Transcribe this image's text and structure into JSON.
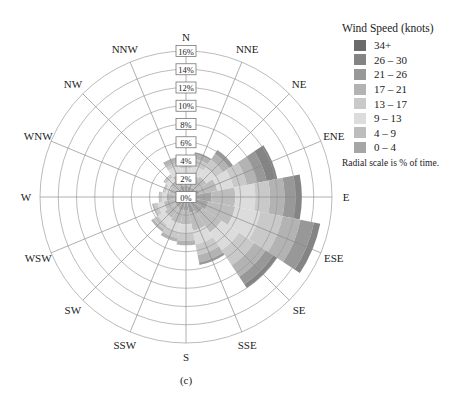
{
  "chart_data": {
    "type": "wind-rose",
    "title": "",
    "caption": "(c)",
    "radial_axis": {
      "unit": "%",
      "range": [
        0,
        16
      ],
      "ticks": [
        "0%",
        "2%",
        "4%",
        "6%",
        "8%",
        "10%",
        "12%",
        "14%",
        "16%"
      ],
      "tick_values": [
        0,
        2,
        4,
        6,
        8,
        10,
        12,
        14,
        16
      ],
      "note": "Radial scale is % of time."
    },
    "directions": [
      "N",
      "NNE",
      "NE",
      "ENE",
      "E",
      "ESE",
      "SE",
      "SSE",
      "S",
      "SSW",
      "SW",
      "WSW",
      "W",
      "WNW",
      "NW",
      "NNW"
    ],
    "legend": {
      "title": "Wind Speed (knots)",
      "placement": "top-right",
      "entries": [
        {
          "label": "34+",
          "color": "#6b6b6b"
        },
        {
          "label": "26 – 30",
          "color": "#848484"
        },
        {
          "label": "21 – 26",
          "color": "#989898"
        },
        {
          "label": "17 – 21",
          "color": "#b3b3b3"
        },
        {
          "label": "13 – 17",
          "color": "#c9c9c9"
        },
        {
          "label": "9 – 13",
          "color": "#dcdcdc"
        },
        {
          "label": "4 – 9",
          "color": "#bdbdbd"
        },
        {
          "label": "0 – 4",
          "color": "#a6a6a6"
        }
      ]
    },
    "speed_bins": [
      "0 – 4",
      "4 – 9",
      "9 – 13",
      "13 – 17",
      "17 – 21",
      "21 – 26",
      "26 – 30",
      "34+"
    ],
    "bin_colors": [
      "#a6a6a6",
      "#bdbdbd",
      "#dcdcdc",
      "#c9c9c9",
      "#b3b3b3",
      "#989898",
      "#848484",
      "#6b6b6b"
    ],
    "series": [
      {
        "direction": "N",
        "values": [
          1.2,
          1.2,
          0.8,
          0.5,
          0.3,
          0,
          0,
          0
        ]
      },
      {
        "direction": "NNE",
        "values": [
          1.2,
          1.3,
          1.0,
          0.8,
          0.5,
          0.2,
          0,
          0
        ]
      },
      {
        "direction": "NE",
        "values": [
          1.2,
          1.5,
          1.2,
          1.0,
          0.8,
          0.5,
          0,
          0
        ]
      },
      {
        "direction": "ENE",
        "values": [
          1.5,
          2.0,
          1.8,
          1.5,
          1.2,
          1.0,
          1.2,
          0
        ]
      },
      {
        "direction": "E",
        "values": [
          2.8,
          2.6,
          2.2,
          1.6,
          1.6,
          1.2,
          0.7,
          0
        ]
      },
      {
        "direction": "ESE",
        "values": [
          2.5,
          3.0,
          2.8,
          2.5,
          2.0,
          1.5,
          0.7,
          0
        ]
      },
      {
        "direction": "SE",
        "values": [
          2.2,
          2.5,
          2.3,
          2.0,
          1.5,
          1.0,
          0.5,
          0
        ]
      },
      {
        "direction": "SSE",
        "values": [
          1.8,
          2.0,
          1.5,
          1.2,
          0.8,
          0.3,
          0,
          0
        ]
      },
      {
        "direction": "S",
        "values": [
          1.5,
          1.5,
          1.0,
          0.8,
          0.5,
          0,
          0,
          0
        ]
      },
      {
        "direction": "SSW",
        "values": [
          1.5,
          1.5,
          1.0,
          0.6,
          0.4,
          0,
          0,
          0
        ]
      },
      {
        "direction": "SW",
        "values": [
          1.4,
          1.4,
          0.9,
          0.6,
          0.3,
          0,
          0,
          0
        ]
      },
      {
        "direction": "WSW",
        "values": [
          1.3,
          1.2,
          0.7,
          0.4,
          0.2,
          0,
          0,
          0
        ]
      },
      {
        "direction": "W",
        "values": [
          1.1,
          1.0,
          0.5,
          0.3,
          0.1,
          0,
          0,
          0
        ]
      },
      {
        "direction": "WNW",
        "values": [
          1.0,
          0.9,
          0.4,
          0.2,
          0.1,
          0,
          0,
          0
        ]
      },
      {
        "direction": "NW",
        "values": [
          1.1,
          1.0,
          0.5,
          0.3,
          0.1,
          0,
          0,
          0
        ]
      },
      {
        "direction": "NNW",
        "values": [
          1.3,
          1.3,
          0.9,
          0.6,
          0.4,
          0,
          0,
          0
        ]
      }
    ],
    "grid": true
  }
}
